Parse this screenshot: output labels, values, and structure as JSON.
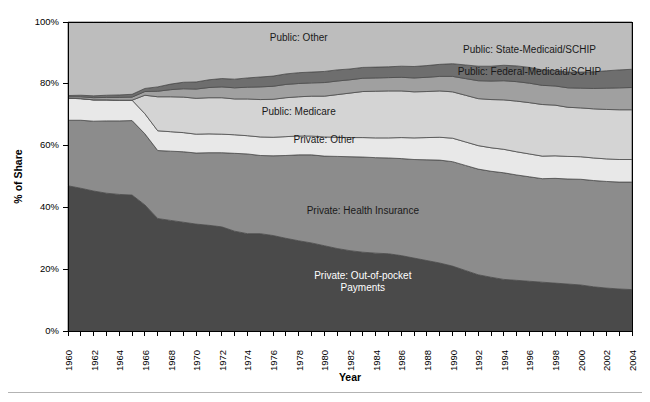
{
  "chart_data": {
    "type": "area",
    "title": "",
    "subtitle": "",
    "xlabel": "Year",
    "ylabel": "% of Share",
    "stacked": true,
    "stack_total": 100,
    "grid": false,
    "legend_position": "inline-labels",
    "xlim": [
      1960,
      2004
    ],
    "ylim": [
      0,
      100
    ],
    "ytick_labels": [
      "0%",
      "20%",
      "40%",
      "60%",
      "80%",
      "100%"
    ],
    "ytick_values": [
      0,
      20,
      40,
      60,
      80,
      100
    ],
    "x_tick_interval": 1,
    "x_label_interval": 2,
    "x": [
      1960,
      1961,
      1962,
      1963,
      1964,
      1965,
      1966,
      1967,
      1968,
      1969,
      1970,
      1971,
      1972,
      1973,
      1974,
      1975,
      1976,
      1977,
      1978,
      1979,
      1980,
      1981,
      1982,
      1983,
      1984,
      1985,
      1986,
      1987,
      1988,
      1989,
      1990,
      1991,
      1992,
      1993,
      1994,
      1995,
      1996,
      1997,
      1998,
      1999,
      2000,
      2001,
      2002,
      2003,
      2004
    ],
    "xtick_labels": [
      "1960",
      "1962",
      "1964",
      "1966",
      "1968",
      "1970",
      "1972",
      "1974",
      "1976",
      "1978",
      "1980",
      "1982",
      "1984",
      "1986",
      "1988",
      "1990",
      "1992",
      "1994",
      "1996",
      "1998",
      "2000",
      "2002",
      "2004"
    ],
    "series": [
      {
        "name": "Private: Out-of-pocket Payments",
        "label": "Private: Out-of-pocket Payments",
        "label_lines": [
          "Private: Out-of-pocket",
          "Payments"
        ],
        "color": "#4a4a4a",
        "label_color": "#ffffff",
        "label_x": 1983,
        "label_y": 15,
        "values": [
          47.0,
          46.2,
          45.3,
          44.6,
          44.2,
          44.0,
          40.8,
          36.4,
          35.8,
          35.2,
          34.6,
          34.2,
          33.7,
          32.3,
          31.5,
          31.5,
          30.9,
          30.0,
          29.2,
          28.5,
          27.6,
          26.7,
          26.0,
          25.5,
          25.2,
          25.0,
          24.4,
          23.6,
          22.8,
          22.0,
          21.0,
          19.6,
          18.2,
          17.4,
          16.7,
          16.4,
          16.1,
          15.8,
          15.5,
          15.2,
          14.9,
          14.3,
          13.9,
          13.6,
          13.4
        ]
      },
      {
        "name": "Private: Health Insurance",
        "label": "Private: Health Insurance",
        "label_lines": [
          "Private: Health Insurance"
        ],
        "color": "#8c8c8c",
        "label_color": "#1a1a1a",
        "label_x": 1983,
        "label_y": 38,
        "values": [
          21.2,
          22.0,
          22.6,
          23.4,
          23.8,
          24.1,
          23.0,
          22.0,
          22.4,
          22.8,
          23.0,
          23.5,
          24.0,
          25.2,
          25.8,
          25.3,
          25.8,
          26.8,
          27.8,
          28.5,
          29.0,
          29.8,
          30.4,
          30.8,
          30.9,
          31.0,
          31.4,
          31.9,
          32.6,
          33.3,
          33.8,
          34.0,
          34.2,
          34.3,
          34.5,
          34.1,
          33.8,
          33.5,
          33.9,
          34.0,
          34.2,
          34.4,
          34.5,
          34.6,
          34.8
        ]
      },
      {
        "name": "Private: Other",
        "label": "Private: Other",
        "label_lines": [
          "Private: Other"
        ],
        "color": "#e8e8e8",
        "label_color": "#1a1a1a",
        "label_x": 1980,
        "label_y": 61,
        "values": [
          7.1,
          7.0,
          6.9,
          6.8,
          6.7,
          6.6,
          6.5,
          6.4,
          6.3,
          6.2,
          6.1,
          6.1,
          6.0,
          6.0,
          5.9,
          6.0,
          6.0,
          6.1,
          6.1,
          6.1,
          6.2,
          6.2,
          6.2,
          6.3,
          6.4,
          6.5,
          6.8,
          7.0,
          7.2,
          7.4,
          7.6,
          7.6,
          7.6,
          7.6,
          7.6,
          7.5,
          7.4,
          7.3,
          7.3,
          7.3,
          7.3,
          7.3,
          7.3,
          7.3,
          7.3
        ]
      },
      {
        "name": "Public: Medicare",
        "label": "Public: Medicare",
        "label_lines": [
          "Public: Medicare"
        ],
        "color": "#d4d4d4",
        "label_color": "#1a1a1a",
        "label_x": 1978,
        "label_y": 70,
        "values": [
          0.0,
          0.0,
          0.0,
          0.0,
          0.0,
          0.0,
          6.0,
          11.0,
          11.3,
          11.5,
          11.6,
          11.7,
          11.8,
          11.6,
          11.9,
          12.1,
          12.3,
          12.6,
          12.7,
          12.9,
          13.2,
          13.8,
          14.4,
          14.9,
          15.1,
          15.2,
          15.1,
          14.9,
          14.9,
          15.0,
          15.0,
          15.1,
          15.2,
          15.6,
          16.0,
          16.4,
          16.6,
          16.7,
          16.4,
          15.9,
          15.8,
          15.9,
          16.0,
          16.1,
          16.1
        ]
      },
      {
        "name": "Public: Federal-Medicaid/SCHIP",
        "label": "Public: Federal-Medicaid/SCHIP",
        "label_lines": [
          "Public: Federal-Medicaid/SCHIP"
        ],
        "color": "#a0a0a0",
        "label_color": "#1a1a1a",
        "label_x": 1996,
        "label_y": 83,
        "values": [
          0.5,
          0.6,
          0.7,
          0.8,
          0.9,
          1.0,
          1.2,
          1.8,
          2.3,
          2.7,
          3.0,
          3.3,
          3.5,
          3.6,
          3.8,
          4.1,
          4.2,
          4.3,
          4.3,
          4.3,
          4.4,
          4.4,
          4.3,
          4.3,
          4.3,
          4.3,
          4.4,
          4.5,
          4.6,
          4.7,
          5.0,
          5.4,
          5.8,
          6.0,
          6.2,
          6.3,
          6.3,
          6.2,
          6.2,
          6.3,
          6.4,
          6.6,
          6.9,
          7.1,
          7.2
        ]
      },
      {
        "name": "Public: State-Medicaid/SCHIP",
        "label": "Public: State-Medicaid/SCHIP",
        "label_lines": [
          "Public: State-Medicaid/SCHIP"
        ],
        "color": "#6e6e6e",
        "label_color": "#1a1a1a",
        "label_x": 1996,
        "label_y": 90,
        "values": [
          0.4,
          0.5,
          0.6,
          0.7,
          0.8,
          0.9,
          1.0,
          1.4,
          1.8,
          2.1,
          2.3,
          2.5,
          2.7,
          2.8,
          3.0,
          3.2,
          3.3,
          3.4,
          3.5,
          3.5,
          3.6,
          3.6,
          3.5,
          3.5,
          3.5,
          3.5,
          3.6,
          3.7,
          3.8,
          3.9,
          4.1,
          4.4,
          4.7,
          4.8,
          5.0,
          5.1,
          5.1,
          5.0,
          5.0,
          5.1,
          5.2,
          5.4,
          5.6,
          5.8,
          5.9
        ]
      },
      {
        "name": "Public: Other",
        "label": "Public: Other",
        "label_lines": [
          "Public: Other"
        ],
        "color": "#bdbdbd",
        "label_color": "#1a1a1a",
        "label_x": 1978,
        "label_y": 94,
        "values": [
          23.8,
          23.7,
          23.9,
          23.7,
          23.6,
          23.4,
          21.5,
          21.0,
          20.1,
          19.5,
          19.4,
          18.7,
          18.3,
          18.5,
          18.1,
          17.8,
          17.5,
          16.8,
          16.4,
          16.2,
          16.0,
          15.5,
          15.2,
          14.7,
          14.6,
          14.5,
          14.3,
          14.4,
          14.1,
          13.7,
          13.5,
          13.9,
          14.3,
          14.3,
          14.0,
          14.2,
          14.7,
          15.5,
          15.7,
          16.2,
          16.2,
          16.1,
          15.8,
          15.5,
          15.3
        ]
      }
    ]
  }
}
